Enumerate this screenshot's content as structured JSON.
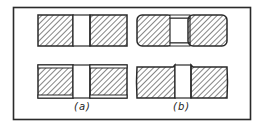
{
  "figure": {
    "labels": {
      "a": "(a)",
      "b": "(b)"
    },
    "colors": {
      "stroke": "#2a2a2a",
      "hatch": "#333333",
      "background": "#ffffff"
    },
    "panels": [
      {
        "id": "a",
        "description": "square-edged blocks with central gap",
        "rows": 2
      },
      {
        "id": "b",
        "description": "rounded-edged blocks with central gap",
        "rows": 2
      }
    ]
  }
}
